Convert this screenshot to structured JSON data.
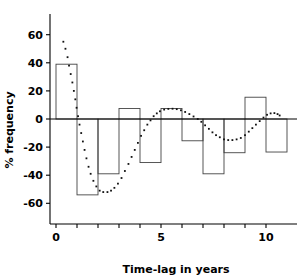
{
  "chart_data": {
    "type": "bar",
    "title": "",
    "xlabel": "Time-lag in years",
    "ylabel": "% frequency",
    "xlim": [
      -0.3,
      10.7
    ],
    "ylim": [
      -60,
      60
    ],
    "grid": false,
    "legend": "none",
    "x_ticks": [
      0,
      1,
      2,
      3,
      4,
      5,
      6,
      7,
      8,
      9,
      10
    ],
    "x_tick_labels": [
      "0",
      "",
      "",
      "",
      "",
      "5",
      "",
      "",
      "",
      "",
      "10"
    ],
    "y_ticks": [
      -60,
      -40,
      -20,
      0,
      20,
      40,
      60
    ],
    "y_tick_labels": [
      "-60",
      "-40",
      "-20",
      "0",
      "20",
      "40",
      "60"
    ],
    "bin_width": 1,
    "bins": [
      {
        "x_start": 0,
        "x_end": 1,
        "value": 39
      },
      {
        "x_start": 1,
        "x_end": 2,
        "value": -54
      },
      {
        "x_start": 2,
        "x_end": 3,
        "value": -39
      },
      {
        "x_start": 3,
        "x_end": 4,
        "value": 7.5
      },
      {
        "x_start": 4,
        "x_end": 5,
        "value": -31
      },
      {
        "x_start": 5,
        "x_end": 6,
        "value": 7.5
      },
      {
        "x_start": 6,
        "x_end": 7,
        "value": -15.5
      },
      {
        "x_start": 7,
        "x_end": 8,
        "value": -39
      },
      {
        "x_start": 8,
        "x_end": 9,
        "value": -24
      },
      {
        "x_start": 9,
        "x_end": 10,
        "value": 15.5
      },
      {
        "x_start": 10,
        "x_end": 11,
        "value": -23.5
      }
    ],
    "categories": [
      "0-1",
      "1-2",
      "2-3",
      "3-4",
      "4-5",
      "5-6",
      "6-7",
      "7-8",
      "8-9",
      "9-10",
      "10-11"
    ],
    "values": [
      39,
      -54,
      -39,
      7.5,
      -31,
      7.5,
      -15.5,
      -39,
      -24,
      15.5,
      -23.5
    ],
    "overlay_curve": {
      "name": "fitted damped oscillation",
      "style": "dotted",
      "points": [
        [
          0.35,
          55
        ],
        [
          0.45,
          50
        ],
        [
          0.55,
          44
        ],
        [
          0.62,
          38
        ],
        [
          0.7,
          32
        ],
        [
          0.78,
          26
        ],
        [
          0.85,
          20
        ],
        [
          0.92,
          14
        ],
        [
          0.98,
          8
        ],
        [
          1.05,
          2
        ],
        [
          1.12,
          -4
        ],
        [
          1.2,
          -10
        ],
        [
          1.28,
          -16
        ],
        [
          1.36,
          -22
        ],
        [
          1.45,
          -28
        ],
        [
          1.55,
          -34
        ],
        [
          1.65,
          -39
        ],
        [
          1.78,
          -44
        ],
        [
          1.92,
          -48
        ],
        [
          2.08,
          -51
        ],
        [
          2.25,
          -52
        ],
        [
          2.45,
          -52
        ],
        [
          2.62,
          -51
        ],
        [
          2.78,
          -49
        ],
        [
          2.95,
          -46
        ],
        [
          3.12,
          -42
        ],
        [
          3.28,
          -37
        ],
        [
          3.45,
          -32
        ],
        [
          3.6,
          -27
        ],
        [
          3.75,
          -22
        ],
        [
          3.9,
          -17
        ],
        [
          4.05,
          -12
        ],
        [
          4.2,
          -8
        ],
        [
          4.35,
          -4
        ],
        [
          4.5,
          -1
        ],
        [
          4.65,
          2
        ],
        [
          4.8,
          4
        ],
        [
          4.95,
          5.5
        ],
        [
          5.15,
          6.7
        ],
        [
          5.35,
          7.2
        ],
        [
          5.55,
          7.3
        ],
        [
          5.75,
          7.0
        ],
        [
          5.95,
          6.2
        ],
        [
          6.15,
          5.0
        ],
        [
          6.35,
          3.5
        ],
        [
          6.55,
          1.8
        ],
        [
          6.75,
          0
        ],
        [
          6.92,
          -2
        ],
        [
          7.1,
          -4.5
        ],
        [
          7.28,
          -7
        ],
        [
          7.45,
          -9.5
        ],
        [
          7.62,
          -11.5
        ],
        [
          7.8,
          -13
        ],
        [
          8.0,
          -14.5
        ],
        [
          8.2,
          -15
        ],
        [
          8.4,
          -15
        ],
        [
          8.6,
          -14.5
        ],
        [
          8.8,
          -13.5
        ],
        [
          9.0,
          -11.5
        ],
        [
          9.18,
          -9
        ],
        [
          9.35,
          -6.5
        ],
        [
          9.52,
          -4
        ],
        [
          9.7,
          -1.5
        ],
        [
          9.88,
          1
        ],
        [
          10.05,
          3
        ],
        [
          10.22,
          4
        ],
        [
          10.4,
          4.2
        ],
        [
          10.55,
          3.5
        ],
        [
          10.65,
          2.5
        ]
      ]
    }
  }
}
